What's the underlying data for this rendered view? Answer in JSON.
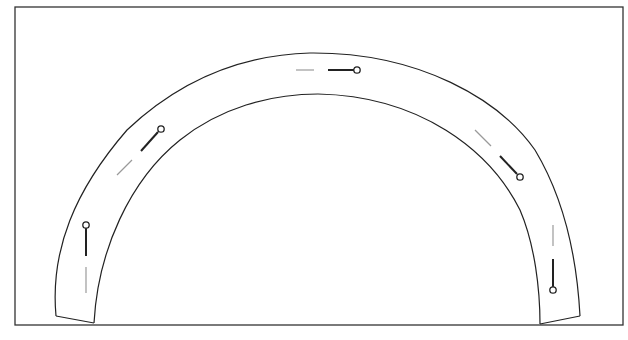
{
  "diagram": {
    "type": "arch-with-pins",
    "colors": {
      "background": "#ffffff",
      "stroke": "#222222",
      "faint": "#9a9a9a"
    },
    "frame": {
      "x": 15,
      "y": 7,
      "width": 608,
      "height": 318
    },
    "arch": {
      "outer": "M56,316 C50,250 75,190 127,130 C180,80 240,55 310,53 C420,52 500,100 535,150 C565,200 577,260 580,316",
      "inner": "M94,323 C98,250 130,180 180,140 C220,108 270,94 318,94 C420,96 490,150 520,210 C535,245 540,290 540,324",
      "left_foot": "M56,316 L94,323",
      "right_foot": "M540,324 L580,316"
    },
    "pins": [
      {
        "name": "pin-top",
        "line": [
          328,
          70,
          354,
          70
        ],
        "dash": [
          296,
          70,
          314,
          70
        ],
        "head": [
          357,
          70
        ]
      },
      {
        "name": "pin-left-upper",
        "line": [
          141,
          151,
          158,
          132
        ],
        "dash": [
          117,
          175,
          132,
          160
        ],
        "head": [
          161,
          129
        ]
      },
      {
        "name": "pin-right-upper",
        "line": [
          500,
          156,
          517,
          174
        ],
        "dash": [
          475,
          130,
          491,
          146
        ],
        "head": [
          520,
          177
        ]
      },
      {
        "name": "pin-left-lower",
        "line": [
          86,
          228,
          86,
          256
        ],
        "dash": [
          86,
          267,
          86,
          293
        ],
        "head": [
          86,
          225
        ]
      },
      {
        "name": "pin-right-lower",
        "line": [
          553,
          259,
          553,
          287
        ],
        "dash": [
          553,
          225,
          553,
          246
        ],
        "head": [
          553,
          290
        ]
      }
    ]
  }
}
